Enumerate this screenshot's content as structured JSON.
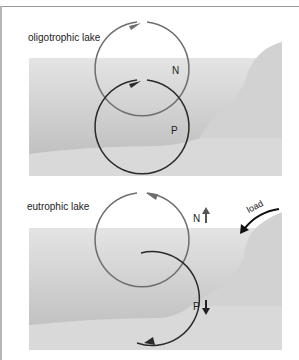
{
  "panels": [
    {
      "id": "oligotrophic",
      "title": "oligotrophic lake",
      "cycles": [
        {
          "label": "N",
          "color": "#6e6e6e",
          "arrow_direction": "clockwise",
          "trend": null
        },
        {
          "label": "P",
          "color": "#2a2a2a",
          "arrow_direction": "clockwise",
          "trend": null
        }
      ]
    },
    {
      "id": "eutrophic",
      "title": "eutrophic lake",
      "cycles": [
        {
          "label": "N",
          "color": "#6e6e6e",
          "arrow_direction": "counterclockwise",
          "trend": "up"
        },
        {
          "label": "P",
          "color": "#2a2a2a",
          "arrow_direction": "counterclockwise",
          "trend": "down"
        }
      ],
      "input": {
        "label": "load"
      }
    }
  ],
  "colors": {
    "water_top": "#e2e2e2",
    "water_bottom": "#bcbcbc",
    "sediment": "#d8d8d8",
    "shore": "#d0d0d0",
    "n_cycle": "#6e6e6e",
    "p_cycle": "#2a2a2a"
  }
}
